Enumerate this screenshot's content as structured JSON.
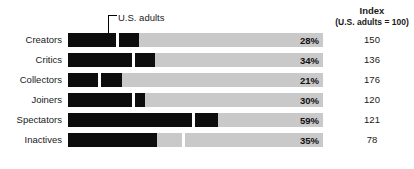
{
  "chart_data": {
    "type": "bar",
    "title": "",
    "xlabel": "",
    "ylabel": "",
    "xlim": [
      0,
      100
    ],
    "grid": false,
    "orientation": "horizontal",
    "categories": [
      "Creators",
      "Critics",
      "Collectors",
      "Joiners",
      "Spectators",
      "Inactives"
    ],
    "values": [
      28,
      34,
      21,
      30,
      59,
      35
    ],
    "value_labels": [
      "28%",
      "34%",
      "21%",
      "30%",
      "59%",
      "35%"
    ],
    "series": [
      {
        "name": "Percent of group",
        "values": [
          28,
          34,
          21,
          30,
          59,
          35
        ]
      },
      {
        "name": "Index (U.S. adults = 100)",
        "values": [
          150,
          136,
          176,
          120,
          121,
          78
        ]
      }
    ],
    "benchmark": {
      "label": "U.S. adults",
      "index_base": 100,
      "benchmark_values": [
        18.7,
        25.0,
        11.9,
        25.0,
        48.8,
        44.9
      ]
    },
    "index_labels": [
      "150",
      "136",
      "176",
      "120",
      "121",
      "78"
    ],
    "annotations": [
      "U.S. adults"
    ],
    "colors": {
      "bar_fill": "#0d0d0d",
      "bar_track": "#c9c9c9",
      "tick": "#ffffff",
      "text": "#1a1a1a",
      "background": "#ffffff"
    }
  },
  "header": {
    "index_title": "Index",
    "index_subtitle": "(U.S. adults = 100)"
  },
  "annotation": {
    "benchmark_label": "U.S. adults"
  },
  "rows": [
    {
      "label": "Creators",
      "pct": "28%",
      "index": "150",
      "fill": 28,
      "tick": 18.7
    },
    {
      "label": "Critics",
      "pct": "34%",
      "index": "136",
      "fill": 34,
      "tick": 25.0
    },
    {
      "label": "Collectors",
      "pct": "21%",
      "index": "176",
      "fill": 21,
      "tick": 11.9
    },
    {
      "label": "Joiners",
      "pct": "30%",
      "index": "120",
      "fill": 30,
      "tick": 25.0
    },
    {
      "label": "Spectators",
      "pct": "59%",
      "index": "121",
      "fill": 59,
      "tick": 48.8
    },
    {
      "label": "Inactives",
      "pct": "35%",
      "index": "78",
      "fill": 35,
      "tick": 44.9
    }
  ]
}
